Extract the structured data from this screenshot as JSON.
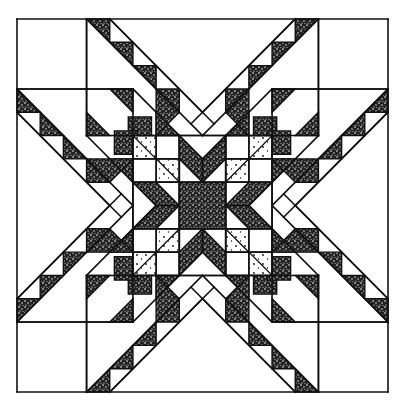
{
  "figure": {
    "frame": {
      "x": 17,
      "y": 19,
      "size_x": 371,
      "size_y": 373
    },
    "grid_units": 16,
    "colors": {
      "line": "#111111",
      "dark_fabric": "#3a3a3a",
      "light_fabric": "#ffffff"
    }
  }
}
